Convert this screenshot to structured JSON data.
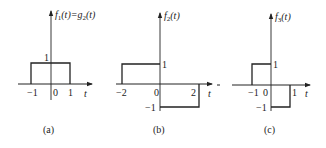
{
  "figure": {
    "panels": [
      {
        "id": "a",
        "caption": "(a)",
        "ylabel_func": "f",
        "ylabel_sub": "1",
        "ylabel_arg": "(t)=",
        "ylabel_func2": "g",
        "ylabel_sub2": "2",
        "ylabel_arg2": "(t)",
        "xlabel": "t",
        "x_ticks": [
          "−1",
          "0",
          "1"
        ],
        "y_ticks": [
          "1"
        ],
        "segments": [
          {
            "t_start": -1,
            "t_end": 1,
            "value": 1
          }
        ]
      },
      {
        "id": "b",
        "caption": "(b)",
        "ylabel_func": "f",
        "ylabel_sub": "2",
        "ylabel_arg": "(t)",
        "xlabel": "t",
        "x_ticks": [
          "−2",
          "0",
          "2"
        ],
        "y_ticks": [
          "1",
          "−1"
        ],
        "segments": [
          {
            "t_start": -2,
            "t_end": 0,
            "value": 1
          },
          {
            "t_start": 0,
            "t_end": 2,
            "value": -1
          }
        ]
      },
      {
        "id": "c",
        "caption": "(c)",
        "ylabel_func": "f",
        "ylabel_sub": "3",
        "ylabel_arg": "(t)",
        "xlabel": "t",
        "x_ticks": [
          "−1",
          "0",
          "1"
        ],
        "y_ticks": [
          "1",
          "−1"
        ],
        "segments": [
          {
            "t_start": -1,
            "t_end": 0,
            "value": 1
          },
          {
            "t_start": 0,
            "t_end": 1,
            "value": -1
          }
        ]
      }
    ],
    "colors": {
      "line": "#222222",
      "background": "#ffffff"
    }
  }
}
